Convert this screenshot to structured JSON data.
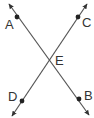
{
  "diagram": {
    "type": "intersecting-lines",
    "line_color": "#555555",
    "point_color": "#222222",
    "lines": [
      {
        "name": "line-AB",
        "from": {
          "x": 9,
          "y": 4
        },
        "to": {
          "x": 89,
          "y": 115
        },
        "arrows": "both"
      },
      {
        "name": "line-CD",
        "from": {
          "x": 87,
          "y": 4
        },
        "to": {
          "x": 12,
          "y": 116
        },
        "arrows": "both"
      }
    ],
    "points": [
      {
        "label": "A",
        "x": 17,
        "y": 17,
        "label_x": 5,
        "label_y": 29,
        "dot": true
      },
      {
        "label": "C",
        "x": 78,
        "y": 17,
        "label_x": 82,
        "label_y": 27,
        "dot": true
      },
      {
        "label": "E",
        "x": 49,
        "y": 59,
        "label_x": 55,
        "label_y": 65,
        "dot": false
      },
      {
        "label": "D",
        "x": 22,
        "y": 101,
        "label_x": 8,
        "label_y": 101,
        "dot": true
      },
      {
        "label": "B",
        "x": 79,
        "y": 99,
        "label_x": 84,
        "label_y": 100,
        "dot": true
      }
    ]
  }
}
